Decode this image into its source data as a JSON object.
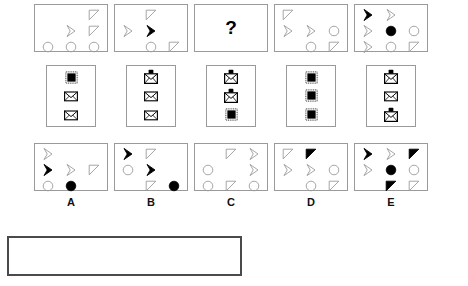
{
  "test": {
    "type": "abstract-reasoning-matrix",
    "question_mark": "?",
    "option_labels": [
      "A",
      "B",
      "C",
      "D",
      "E"
    ]
  },
  "shape_glyphs": {
    "chevron_outline": "chevron-outline-icon",
    "chevron_filled": "chevron-filled-icon",
    "triangle_outline": "triangle-outline-icon",
    "triangle_filled": "triangle-filled-icon",
    "circle_outline": "circle-outline-icon",
    "circle_filled": "circle-filled-icon",
    "square_filled": "filled-square-icon",
    "envelope": "envelope-icon",
    "lock": "locked-envelope-icon",
    "empty": "empty-cell"
  },
  "colors": {
    "stroke": "#9a9a9a",
    "fill_dark": "#000000",
    "panel_border": "#9a9a9a",
    "answer_box_border": "#4a4a4a",
    "background": "#ffffff"
  },
  "sequence_row": {
    "name": "top-sequence-row",
    "panels": [
      {
        "name": "sequence-panel-1",
        "cells": [
          "empty",
          "empty",
          "triangle_outline",
          "empty",
          "chevron_outline",
          "triangle_outline",
          "circle_outline",
          "circle_outline",
          "circle_outline"
        ]
      },
      {
        "name": "sequence-panel-2",
        "cells": [
          "empty",
          "triangle_outline",
          "empty",
          "chevron_outline",
          "chevron_filled",
          "empty",
          "empty",
          "circle_outline",
          "triangle_outline"
        ]
      },
      {
        "name": "sequence-panel-3-question",
        "cells": [
          "question"
        ]
      },
      {
        "name": "sequence-panel-4",
        "cells": [
          "triangle_outline",
          "empty",
          "empty",
          "chevron_outline",
          "chevron_outline",
          "circle_outline",
          "empty",
          "circle_outline",
          "triangle_outline"
        ]
      },
      {
        "name": "sequence-panel-5",
        "cells": [
          "chevron_filled",
          "chevron_outline",
          "empty",
          "chevron_outline",
          "circle_filled",
          "circle_outline",
          "chevron_outline",
          "circle_outline",
          "triangle_outline"
        ]
      }
    ]
  },
  "icon_row": {
    "name": "middle-icon-row",
    "panels": [
      {
        "name": "icon-panel-1",
        "cells": [
          "square_filled",
          "envelope",
          "envelope"
        ]
      },
      {
        "name": "icon-panel-2",
        "cells": [
          "lock",
          "envelope",
          "envelope"
        ]
      },
      {
        "name": "icon-panel-3",
        "cells": [
          "lock",
          "lock",
          "square_filled"
        ]
      },
      {
        "name": "icon-panel-4",
        "cells": [
          "square_filled",
          "square_filled",
          "square_filled"
        ]
      },
      {
        "name": "icon-panel-5",
        "cells": [
          "lock",
          "envelope",
          "lock"
        ]
      }
    ]
  },
  "options_row": {
    "name": "answer-options-row",
    "panels": [
      {
        "name": "option-panel-a",
        "label": "A",
        "cells": [
          "chevron_outline",
          "empty",
          "empty",
          "chevron_filled",
          "chevron_outline",
          "triangle_outline",
          "circle_outline",
          "circle_filled",
          "empty"
        ]
      },
      {
        "name": "option-panel-b",
        "label": "B",
        "cells": [
          "chevron_filled",
          "triangle_outline",
          "empty",
          "circle_outline",
          "chevron_filled",
          "empty",
          "empty",
          "triangle_outline",
          "circle_filled"
        ]
      },
      {
        "name": "option-panel-c",
        "label": "C",
        "cells": [
          "empty",
          "triangle_outline",
          "chevron_outline",
          "circle_outline",
          "empty",
          "chevron_outline",
          "circle_outline",
          "triangle_outline",
          "circle_outline"
        ]
      },
      {
        "name": "option-panel-d",
        "label": "D",
        "cells": [
          "triangle_outline",
          "triangle_filled",
          "empty",
          "chevron_outline",
          "chevron_outline",
          "circle_outline",
          "empty",
          "circle_outline",
          "triangle_outline"
        ]
      },
      {
        "name": "option-panel-e",
        "label": "E",
        "cells": [
          "chevron_filled",
          "chevron_outline",
          "triangle_filled",
          "chevron_outline",
          "circle_filled",
          "circle_outline",
          "empty",
          "triangle_filled",
          "triangle_outline"
        ]
      }
    ]
  },
  "answer_box": {
    "name": "answer-entry-box",
    "value": ""
  }
}
